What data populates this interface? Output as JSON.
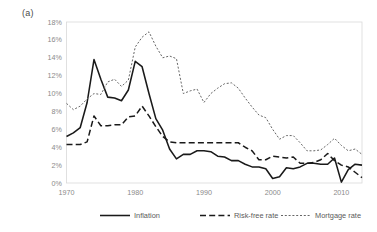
{
  "panel": {
    "label": "(a)"
  },
  "chart_data": {
    "type": "line",
    "title": "",
    "xlabel": "",
    "ylabel": "",
    "xlim": [
      1970,
      2013
    ],
    "ylim": [
      0,
      18
    ],
    "grid": false,
    "legend_position": "bottom",
    "ytick_labels": [
      "0%",
      "2%",
      "4%",
      "6%",
      "8%",
      "10%",
      "12%",
      "14%",
      "16%",
      "18%"
    ],
    "ytick_values": [
      0,
      2,
      4,
      6,
      8,
      10,
      12,
      14,
      16,
      18
    ],
    "xtick_labels": [
      "1970",
      "1980",
      "1990",
      "2000",
      "2010"
    ],
    "xtick_values": [
      1970,
      1980,
      1990,
      2000,
      2010
    ],
    "x": [
      1970,
      1971,
      1972,
      1973,
      1974,
      1975,
      1976,
      1977,
      1978,
      1979,
      1980,
      1981,
      1982,
      1983,
      1984,
      1985,
      1986,
      1987,
      1988,
      1989,
      1990,
      1991,
      1992,
      1993,
      1994,
      1995,
      1996,
      1997,
      1998,
      1999,
      2000,
      2001,
      2002,
      2003,
      2004,
      2005,
      2006,
      2007,
      2008,
      2009,
      2010,
      2011,
      2012,
      2013
    ],
    "series": [
      {
        "name": "Inflation",
        "style": "solid",
        "color": "#1a1a1a",
        "values": [
          5.2,
          5.6,
          6.2,
          9.0,
          13.8,
          11.6,
          9.6,
          9.5,
          9.2,
          10.4,
          13.6,
          13.0,
          10.0,
          7.2,
          5.9,
          3.8,
          2.7,
          3.2,
          3.2,
          3.6,
          3.6,
          3.5,
          3.0,
          2.9,
          2.5,
          2.5,
          2.1,
          1.8,
          1.8,
          1.6,
          0.5,
          0.7,
          1.7,
          1.6,
          1.8,
          2.2,
          2.2,
          2.1,
          2.1,
          2.8,
          0.1,
          1.5,
          2.1,
          2.0
        ]
      },
      {
        "name": "Risk-free rate",
        "style": "dashed",
        "color": "#1a1a1a",
        "values": [
          4.3,
          4.3,
          4.3,
          4.6,
          7.5,
          6.4,
          6.4,
          6.5,
          6.5,
          7.4,
          7.5,
          8.6,
          7.5,
          6.3,
          5.2,
          4.6,
          4.5,
          4.5,
          4.5,
          4.5,
          4.5,
          4.5,
          4.5,
          4.5,
          4.5,
          4.5,
          4.0,
          3.6,
          2.6,
          2.6,
          3.0,
          2.9,
          2.8,
          2.9,
          2.2,
          2.2,
          2.3,
          2.6,
          3.3,
          2.5,
          2.0,
          1.8,
          1.2,
          0.6
        ]
      },
      {
        "name": "Mortgage rate",
        "style": "dotted",
        "color": "#666666",
        "values": [
          8.9,
          8.2,
          8.6,
          9.4,
          10.0,
          9.9,
          11.3,
          11.6,
          10.8,
          11.5,
          15.2,
          16.3,
          16.9,
          15.3,
          14.0,
          14.2,
          13.9,
          10.0,
          10.3,
          10.5,
          9.0,
          10.0,
          10.6,
          11.1,
          11.2,
          10.6,
          9.5,
          8.5,
          7.6,
          7.3,
          6.0,
          4.9,
          5.3,
          5.3,
          4.5,
          3.6,
          3.6,
          3.7,
          4.3,
          5.0,
          4.2,
          3.6,
          3.8,
          3.2
        ]
      }
    ]
  }
}
